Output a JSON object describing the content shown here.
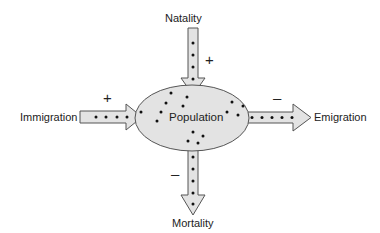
{
  "diagram": {
    "center": {
      "label": "Population"
    },
    "flows": [
      {
        "id": "natality",
        "label": "Natality",
        "sign": "+",
        "direction": "in"
      },
      {
        "id": "immigration",
        "label": "Immigration",
        "sign": "+",
        "direction": "in"
      },
      {
        "id": "emigration",
        "label": "Emigration",
        "sign": "–",
        "direction": "out"
      },
      {
        "id": "mortality",
        "label": "Mortality",
        "sign": "–",
        "direction": "out"
      }
    ]
  },
  "colors": {
    "fill": "#e3e3e3",
    "stroke": "#555555",
    "dot": "#111111"
  }
}
